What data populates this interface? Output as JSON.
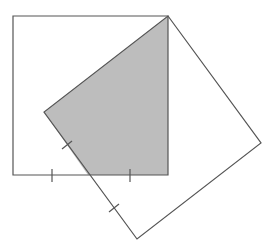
{
  "diagram": {
    "colors": {
      "stroke": "#555555",
      "shade": "#bdbdbd",
      "background": "#ffffff"
    },
    "square_axis_aligned": {
      "points": [
        [
          13,
          16
        ],
        [
          168,
          16
        ],
        [
          168,
          175
        ],
        [
          13,
          175
        ]
      ]
    },
    "square_rotated": {
      "points": [
        [
          168,
          16
        ],
        [
          261,
          143
        ],
        [
          137,
          239
        ],
        [
          44,
          112
        ]
      ]
    },
    "shaded_region": {
      "points": [
        [
          168,
          16
        ],
        [
          44,
          112
        ],
        [
          88,
          175
        ],
        [
          168,
          175
        ]
      ]
    },
    "tick_marks": [
      {
        "x1": 52,
        "y1": 169,
        "x2": 52,
        "y2": 182
      },
      {
        "x1": 130,
        "y1": 169,
        "x2": 130,
        "y2": 182
      },
      {
        "x1": 62,
        "y1": 149,
        "x2": 72,
        "y2": 141
      },
      {
        "x1": 109,
        "y1": 212,
        "x2": 119,
        "y2": 204
      }
    ]
  }
}
